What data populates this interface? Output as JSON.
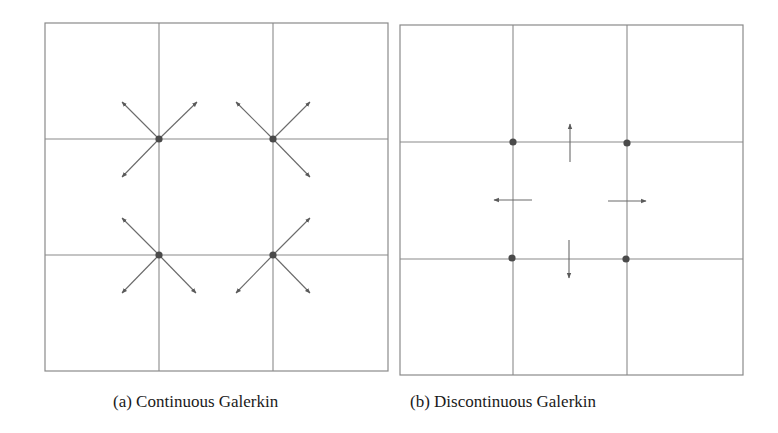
{
  "figure": {
    "panels": [
      {
        "id": "a",
        "caption": "(a) Continuous Galerkin",
        "box": {
          "x1": 45,
          "y1": 23,
          "x2": 388,
          "y2": 371
        },
        "grid_x": [
          159,
          273
        ],
        "grid_y": [
          139,
          255
        ],
        "nodes": [
          [
            159,
            139
          ],
          [
            273,
            139
          ],
          [
            159,
            255
          ],
          [
            273,
            255
          ]
        ],
        "arrows": [
          [
            159,
            139,
            122,
            102
          ],
          [
            159,
            139,
            197,
            102
          ],
          [
            159,
            139,
            122,
            177
          ],
          [
            273,
            139,
            236,
            102
          ],
          [
            273,
            139,
            310,
            102
          ],
          [
            273,
            139,
            310,
            177
          ],
          [
            159,
            255,
            122,
            218
          ],
          [
            159,
            255,
            122,
            293
          ],
          [
            159,
            255,
            196,
            293
          ],
          [
            273,
            255,
            310,
            218
          ],
          [
            273,
            255,
            236,
            293
          ],
          [
            273,
            255,
            310,
            293
          ]
        ]
      },
      {
        "id": "b",
        "caption": "(b) Discontinuous Galerkin",
        "box": {
          "x1": 400,
          "y1": 25,
          "x2": 743,
          "y2": 375
        },
        "grid_x": [
          513,
          627
        ],
        "grid_y": [
          142,
          259
        ],
        "nodes": [
          [
            513,
            142
          ],
          [
            627,
            143
          ],
          [
            512,
            258
          ],
          [
            626,
            259
          ]
        ],
        "arrows": [
          [
            570,
            162,
            570,
            124
          ],
          [
            532,
            200,
            494,
            200
          ],
          [
            608,
            201,
            646,
            201
          ],
          [
            569,
            240,
            569,
            278
          ]
        ]
      }
    ],
    "colors": {
      "line": "#8a8a8a",
      "node": "#4a4a4a",
      "arrow": "#6a6a6a"
    }
  }
}
